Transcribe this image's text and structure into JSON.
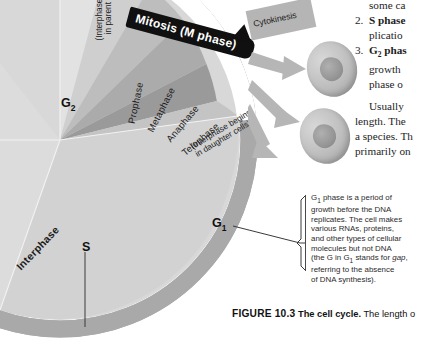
{
  "figure": {
    "diagram_title": "The cell cycle",
    "banner": {
      "mitosis_label": "Mitosis (M phase)",
      "cytokinesis_label": "Cytokinesis"
    },
    "wheel": {
      "interphase_arc_label": "Interphase",
      "phase_tags": {
        "g2": "G",
        "g2_sub": "2",
        "s": "S",
        "g1": "G",
        "g1_sub": "1"
      },
      "mitosis_subphases": [
        "Prophase",
        "Metaphase",
        "Anaphase",
        "Telophase"
      ],
      "paren_notes": {
        "parent": "(Interphase ends in parent cell)",
        "parent_l1": "(Interphase ends",
        "parent_l2": "in parent cell)",
        "daughter_l1": "(Interphase begins",
        "daughter_l2": "in daughter cells)"
      }
    },
    "g1_note": {
      "lines": [
        "G1 phase is a period of",
        "growth before the DNA",
        "replicates. The cell makes",
        "various RNAs, proteins,",
        "and other types of cellular",
        "molecules but not DNA",
        "(the G in G1 stands for gap,",
        "referring to the absence",
        "of DNA synthesis)."
      ]
    },
    "caption": {
      "figure_number": "FIGURE 10.3",
      "title": "The cell cycle.",
      "body": "The length o"
    },
    "book_text": {
      "lines": [
        "some ca",
        "S phase",
        "plicatio",
        "G2 phas",
        "growth",
        "phase o",
        "Usually",
        "length. The",
        "a species. Th",
        "primarily on"
      ],
      "item2_num": "2.",
      "item2_bold": "S phase",
      "item2_rest": "plicatio",
      "item3_num": "3.",
      "item3_bold": "G",
      "item3_sub": "2",
      "item3_bold2": " phas",
      "item3_l2": "growth",
      "item3_l3": "phase o",
      "lead": "some ca",
      "para_l1": "Usually",
      "para_l2": "length. The",
      "para_l3": "a species. Th",
      "para_l4": "primarily on"
    },
    "colors": {
      "ring": "#a9a9a9",
      "interphase_fill": "#d6d6d6",
      "g2_fill": "#c9c9c9",
      "s_fill": "#d9d9d9",
      "g1_fill": "#d2d2d2",
      "mitosis_banner": "#101010",
      "arrow": "#b4b4b4",
      "cell_body": "#c0c0c0",
      "text": "#1b1b1b"
    }
  }
}
